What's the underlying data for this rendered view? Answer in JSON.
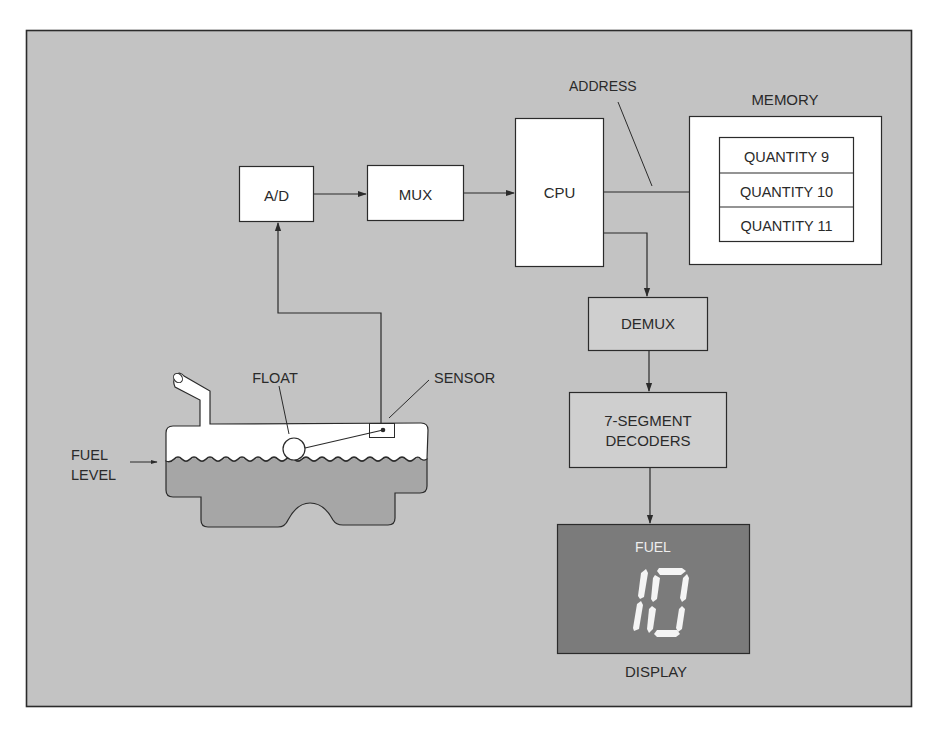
{
  "diagram": {
    "colors": {
      "page_background": "#ffffff",
      "frame_fill": "#c3c3c3",
      "frame_stroke": "#2b2b2b",
      "box_white": "#ffffff",
      "box_gray": "#cfcfcf",
      "fuel_fill": "#a6a6a6",
      "display_fill": "#7b7b7b",
      "display_text": "#f2f2f2",
      "line": "#2b2b2b"
    },
    "blocks": {
      "ad": "A/D",
      "mux": "MUX",
      "cpu": "CPU",
      "demux": "DEMUX",
      "decoders_line1": "7-SEGMENT",
      "decoders_line2": "DECODERS"
    },
    "memory": {
      "title": "MEMORY",
      "rows": [
        "QUANTITY 9",
        "QUANTITY 10",
        "QUANTITY 11"
      ]
    },
    "labels": {
      "address": "ADDRESS",
      "float": "FLOAT",
      "sensor": "SENSOR",
      "fuel_level_line1": "FUEL",
      "fuel_level_line2": "LEVEL"
    },
    "display": {
      "caption": "DISPLAY",
      "heading": "FUEL",
      "value": "10"
    }
  }
}
